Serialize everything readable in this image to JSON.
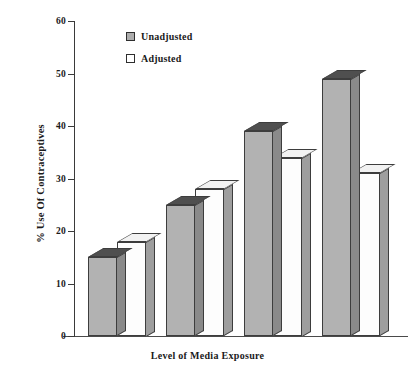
{
  "chart_data": {
    "type": "bar",
    "title": "",
    "xlabel": "Level of Media Exposure",
    "ylabel": "% Use Of Contraceptives",
    "ylim": [
      0,
      60
    ],
    "yticks": [
      0,
      10,
      20,
      30,
      40,
      50,
      60
    ],
    "grid": false,
    "legend_position": "top-left-inside",
    "categories": [
      "",
      "",
      "",
      ""
    ],
    "series": [
      {
        "name": "Unadjusted",
        "values": [
          15,
          25,
          39,
          49
        ],
        "color": "#b2b2b2"
      },
      {
        "name": "Adjusted",
        "values": [
          18,
          28,
          34,
          31
        ],
        "color": "#fdfdfd"
      }
    ]
  },
  "axes": {
    "y_title": "% Use Of Contraceptives",
    "x_title": "Level of Media Exposure",
    "tick_labels": [
      "60",
      "50",
      "40",
      "30",
      "20",
      "10",
      "0"
    ]
  },
  "legend": {
    "entries": [
      {
        "label": "Unadjusted",
        "swatch": "gray-square-icon"
      },
      {
        "label": "Adjusted",
        "swatch": "white-square-icon"
      }
    ]
  }
}
